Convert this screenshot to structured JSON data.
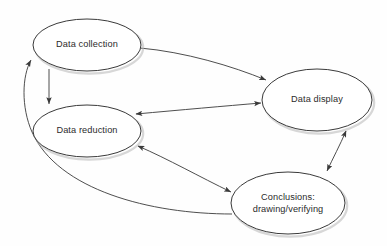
{
  "diagram": {
    "background_color": "#fefefe",
    "node_fill": "#ffffff",
    "node_stroke": "#3a3a3a",
    "edge_stroke": "#3a3a3a",
    "text_color": "#2b2b2b",
    "nodes": [
      {
        "id": "data-collection",
        "label": "Data collection",
        "lines": [
          "Data collection"
        ],
        "cx": 87,
        "cy": 45,
        "rx": 54,
        "ry": 26
      },
      {
        "id": "data-reduction",
        "label": "Data reduction",
        "lines": [
          "Data reduction"
        ],
        "cx": 87,
        "cy": 131,
        "rx": 54,
        "ry": 26
      },
      {
        "id": "data-display",
        "label": "Data display",
        "lines": [
          "Data display"
        ],
        "cx": 317,
        "cy": 100,
        "rx": 55,
        "ry": 31
      },
      {
        "id": "conclusions",
        "label": "Conclusions: drawing/verifying",
        "lines": [
          "Conclusions:",
          "drawing/verifying"
        ],
        "cx": 288,
        "cy": 203,
        "rx": 57,
        "ry": 31
      }
    ],
    "edges": [
      {
        "id": "collection-to-reduction",
        "from": "data-collection",
        "to": "data-reduction",
        "arrowheads": "end",
        "path": "M 49 69 L 49 104"
      },
      {
        "id": "collection-to-display",
        "from": "data-collection",
        "to": "data-display",
        "arrowheads": "end",
        "path": "M 140 48 C 185 52 232 66 266 80"
      },
      {
        "id": "reduction-display",
        "from": "data-reduction",
        "to": "data-display",
        "arrowheads": "both",
        "path": "M 136 114 C 180 110 225 106 261 103"
      },
      {
        "id": "reduction-conclusions",
        "from": "data-reduction",
        "to": "conclusions",
        "arrowheads": "both",
        "path": "M 138 146 C 168 159 200 177 231 192"
      },
      {
        "id": "display-conclusions",
        "from": "data-display",
        "to": "conclusions",
        "arrowheads": "both",
        "path": "M 346 131 C 340 145 333 158 327 171"
      },
      {
        "id": "conclusions-to-collection",
        "from": "conclusions",
        "to": "data-collection",
        "arrowheads": "end",
        "path": "M 232 214 C 150 214 58 190 32 132 C 21 107 22 76 31 60"
      }
    ]
  }
}
